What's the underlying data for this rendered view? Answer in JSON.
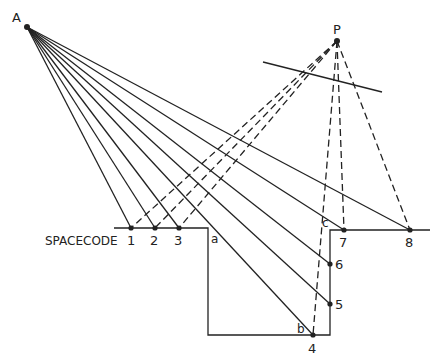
{
  "diagram": {
    "points": {
      "A": {
        "label": "A",
        "x": 27,
        "y": 27
      },
      "P": {
        "label": "P",
        "x": 337,
        "y": 41
      }
    },
    "spacecode_label": "SPACECODE",
    "profile_labels": {
      "a": "a",
      "b": "b",
      "c": "c"
    },
    "numbered_points": [
      {
        "label": "1",
        "x": 131,
        "y": 228
      },
      {
        "label": "2",
        "x": 155,
        "y": 228
      },
      {
        "label": "3",
        "x": 179,
        "y": 228
      },
      {
        "label": "4",
        "x": 313,
        "y": 335
      },
      {
        "label": "5",
        "x": 330,
        "y": 304
      },
      {
        "label": "6",
        "x": 330,
        "y": 264
      },
      {
        "label": "7",
        "x": 344,
        "y": 230
      },
      {
        "label": "8",
        "x": 410,
        "y": 230
      }
    ],
    "line_color": "#222222"
  }
}
